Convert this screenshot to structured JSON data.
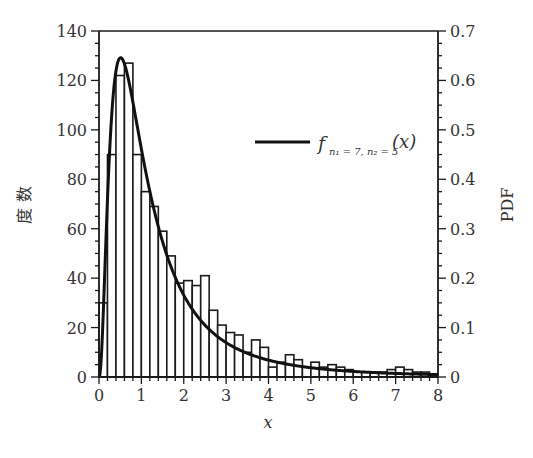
{
  "chart_data": {
    "type": "bar",
    "subtype": "histogram_with_pdf_overlay",
    "title": "",
    "xlabel": "x",
    "ylabel_left": "度 数",
    "ylabel_right": "PDF",
    "xlim": [
      0,
      8
    ],
    "ylim_left": [
      0,
      140
    ],
    "ylim_right": [
      0,
      0.7
    ],
    "x_ticks": [
      "0",
      "1",
      "2",
      "3",
      "4",
      "5",
      "6",
      "7",
      "8"
    ],
    "y_ticks_left": [
      "0",
      "20",
      "40",
      "60",
      "80",
      "100",
      "120",
      "140"
    ],
    "y_ticks_right": [
      "0",
      "0.1",
      "0.2",
      "0.3",
      "0.4",
      "0.5",
      "0.6",
      "0.7"
    ],
    "grid": false,
    "legend_position": "upper right",
    "bin_width": 0.2,
    "bin_edges_start": 0,
    "histogram_counts": [
      30,
      90,
      122,
      127,
      90,
      75,
      69,
      59,
      49,
      38,
      39,
      37,
      41,
      27,
      21,
      18,
      17,
      10,
      15,
      12,
      4,
      6,
      9,
      7,
      4,
      6,
      4,
      5,
      4,
      3,
      2,
      2,
      2,
      2,
      3,
      4,
      3,
      2,
      2,
      1
    ],
    "series": [
      {
        "name": "f_{n1=7, n2=5}(x)",
        "type": "line",
        "axis": "right",
        "description": "F-distribution PDF with n1=7, n2=5 degrees of freedom",
        "params": {
          "n1": 7,
          "n2": 5
        }
      }
    ]
  },
  "legend": {
    "label_f": "f",
    "label_sub": "n₁ = 7, n₂ = 5",
    "label_arg": "(x)"
  },
  "colors": {
    "axis": "#1a1a1a",
    "bar_edge": "#1a1a1a",
    "bar_fill": "#ffffff",
    "curve": "#111111"
  }
}
